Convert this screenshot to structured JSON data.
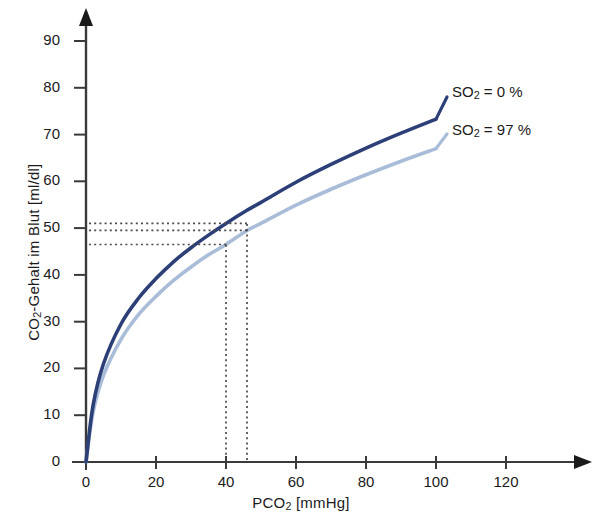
{
  "chart_data": {
    "type": "line",
    "title": "",
    "xlabel": "PCO2 [mmHg]",
    "xlabel_parts": {
      "prefix": "PCO",
      "sub": "2",
      "suffix": " [mmHg]"
    },
    "ylabel": "CO2-Gehalt im Blut [ml/dl]",
    "ylabel_parts": {
      "prefix": "CO",
      "sub": "2",
      "suffix": "-Gehalt im Blut [ml/dl]"
    },
    "xlim": [
      0,
      140
    ],
    "ylim": [
      0,
      95
    ],
    "xticks": [
      0,
      20,
      40,
      60,
      80,
      100,
      120
    ],
    "yticks": [
      0,
      10,
      20,
      30,
      40,
      50,
      60,
      70,
      80,
      90
    ],
    "grid": false,
    "legend_position": "right-of-curve-ends",
    "series": [
      {
        "name": "SO2 = 0 %",
        "label_parts": {
          "prefix": "SO",
          "sub": "2",
          "suffix": " = 0 %"
        },
        "color": "#2c3f77",
        "x": [
          0,
          2,
          5,
          10,
          15,
          20,
          25,
          30,
          35,
          40,
          46,
          50,
          60,
          70,
          80,
          90,
          100
        ],
        "y": [
          0,
          12.0,
          21.0,
          29.5,
          35.0,
          39.2,
          42.8,
          45.8,
          48.5,
          51.0,
          53.8,
          55.5,
          59.8,
          63.6,
          67.1,
          70.3,
          73.3
        ]
      },
      {
        "name": "SO2 = 97 %",
        "label_parts": {
          "prefix": "SO",
          "sub": "2",
          "suffix": " = 97 %"
        },
        "color": "#a9bdd9",
        "x": [
          0,
          2,
          5,
          10,
          15,
          20,
          25,
          30,
          35,
          40,
          46,
          50,
          60,
          70,
          80,
          90,
          100
        ],
        "y": [
          0,
          10.5,
          18.5,
          26.2,
          31.5,
          35.4,
          38.8,
          41.7,
          44.3,
          46.5,
          49.5,
          51.0,
          54.9,
          58.3,
          61.4,
          64.3,
          67.0
        ]
      }
    ],
    "annotations": {
      "style": "dotted-construction-lines",
      "color": "#4a4a4a",
      "horizontal_lines": [
        {
          "y": 51.0,
          "from_x": 0,
          "to_x": 46,
          "note": "SO2=0% at PCO2=40"
        },
        {
          "y": 49.5,
          "from_x": 0,
          "to_x": 46,
          "note": "SO2=97% at PCO2=46"
        },
        {
          "y": 46.5,
          "from_x": 0,
          "to_x": 40,
          "note": "SO2=97% at PCO2=40"
        }
      ],
      "vertical_lines": [
        {
          "x": 40,
          "from_y": 0,
          "to_y": 46.5
        },
        {
          "x": 46,
          "from_y": 0,
          "to_y": 51.0
        }
      ]
    },
    "axis_arrows": {
      "x": "right",
      "y": "up"
    }
  }
}
